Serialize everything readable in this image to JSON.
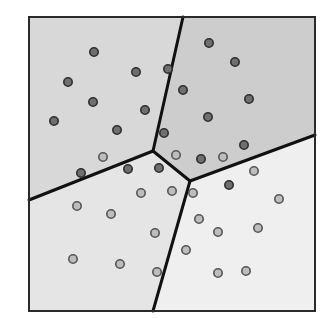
{
  "diagram": {
    "type": "voronoi",
    "width": 329,
    "height": 318,
    "frame": {
      "x1": 29,
      "y1": 17,
      "x2": 315,
      "y2": 311,
      "stroke": "#2a2a2a",
      "stroke_width": 2
    },
    "boundary_color": "#111111",
    "boundary_width": 3,
    "junctions": {
      "A": [
        153,
        151
      ],
      "B": [
        190,
        181
      ]
    },
    "regions": [
      {
        "name": "top-left",
        "fill": "#d8d8d8",
        "points": [
          [
            29,
            17
          ],
          [
            183,
            17
          ],
          [
            153,
            151
          ],
          [
            29,
            200
          ]
        ]
      },
      {
        "name": "top-right",
        "fill": "#cdcdcd",
        "points": [
          [
            183,
            17
          ],
          [
            315,
            17
          ],
          [
            315,
            135
          ],
          [
            190,
            181
          ],
          [
            153,
            151
          ]
        ]
      },
      {
        "name": "bottom-left",
        "fill": "#e5e5e5",
        "points": [
          [
            29,
            200
          ],
          [
            153,
            151
          ],
          [
            190,
            181
          ],
          [
            153,
            311
          ],
          [
            29,
            311
          ]
        ]
      },
      {
        "name": "bottom-right",
        "fill": "#efefef",
        "points": [
          [
            190,
            181
          ],
          [
            315,
            135
          ],
          [
            315,
            311
          ],
          [
            153,
            311
          ]
        ]
      }
    ],
    "edges": [
      [
        [
          183,
          17
        ],
        [
          153,
          151
        ]
      ],
      [
        [
          153,
          151
        ],
        [
          29,
          200
        ]
      ],
      [
        [
          153,
          151
        ],
        [
          190,
          181
        ]
      ],
      [
        [
          190,
          181
        ],
        [
          315,
          135
        ]
      ],
      [
        [
          190,
          181
        ],
        [
          153,
          311
        ]
      ]
    ],
    "dot_styles": {
      "dark": {
        "fill": "#6f6f6f",
        "stroke": "#2e2e2e"
      },
      "light": {
        "fill": "#bdbdbd",
        "stroke": "#555555"
      }
    },
    "dots": [
      {
        "x": 94,
        "y": 52,
        "style": "dark"
      },
      {
        "x": 68,
        "y": 82,
        "style": "dark"
      },
      {
        "x": 136,
        "y": 72,
        "style": "dark"
      },
      {
        "x": 168,
        "y": 69,
        "style": "dark"
      },
      {
        "x": 93,
        "y": 102,
        "style": "dark"
      },
      {
        "x": 145,
        "y": 110,
        "style": "dark"
      },
      {
        "x": 54,
        "y": 121,
        "style": "dark"
      },
      {
        "x": 117,
        "y": 130,
        "style": "dark"
      },
      {
        "x": 164,
        "y": 133,
        "style": "dark"
      },
      {
        "x": 103,
        "y": 157,
        "style": "light"
      },
      {
        "x": 81,
        "y": 173,
        "style": "dark"
      },
      {
        "x": 209,
        "y": 43,
        "style": "dark"
      },
      {
        "x": 235,
        "y": 62,
        "style": "dark"
      },
      {
        "x": 183,
        "y": 90,
        "style": "dark"
      },
      {
        "x": 249,
        "y": 99,
        "style": "dark"
      },
      {
        "x": 208,
        "y": 117,
        "style": "dark"
      },
      {
        "x": 244,
        "y": 145,
        "style": "dark"
      },
      {
        "x": 176,
        "y": 155,
        "style": "light"
      },
      {
        "x": 201,
        "y": 159,
        "style": "dark"
      },
      {
        "x": 223,
        "y": 157,
        "style": "light"
      },
      {
        "x": 128,
        "y": 169,
        "style": "dark"
      },
      {
        "x": 159,
        "y": 168,
        "style": "dark"
      },
      {
        "x": 141,
        "y": 193,
        "style": "light"
      },
      {
        "x": 172,
        "y": 191,
        "style": "light"
      },
      {
        "x": 77,
        "y": 206,
        "style": "light"
      },
      {
        "x": 111,
        "y": 214,
        "style": "light"
      },
      {
        "x": 155,
        "y": 233,
        "style": "light"
      },
      {
        "x": 73,
        "y": 259,
        "style": "light"
      },
      {
        "x": 120,
        "y": 264,
        "style": "light"
      },
      {
        "x": 157,
        "y": 272,
        "style": "light"
      },
      {
        "x": 254,
        "y": 171,
        "style": "light"
      },
      {
        "x": 229,
        "y": 185,
        "style": "dark"
      },
      {
        "x": 193,
        "y": 193,
        "style": "light"
      },
      {
        "x": 279,
        "y": 199,
        "style": "light"
      },
      {
        "x": 199,
        "y": 219,
        "style": "light"
      },
      {
        "x": 218,
        "y": 232,
        "style": "light"
      },
      {
        "x": 258,
        "y": 228,
        "style": "light"
      },
      {
        "x": 186,
        "y": 250,
        "style": "light"
      },
      {
        "x": 218,
        "y": 273,
        "style": "light"
      },
      {
        "x": 246,
        "y": 271,
        "style": "light"
      }
    ],
    "dot_radius": 4.2
  }
}
